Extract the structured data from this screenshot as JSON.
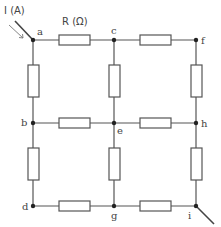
{
  "diagram": {
    "type": "resistor-grid-circuit",
    "current_label": "I (A)",
    "resistance_label": "R (Ω)",
    "input_node": "a",
    "output_node": "i",
    "nodes": [
      {
        "id": "a",
        "label": "a",
        "x": 33,
        "y": 40
      },
      {
        "id": "c",
        "label": "c",
        "x": 114,
        "y": 40
      },
      {
        "id": "f",
        "label": "f",
        "x": 196,
        "y": 40
      },
      {
        "id": "b",
        "label": "b",
        "x": 33,
        "y": 123
      },
      {
        "id": "e",
        "label": "e",
        "x": 114,
        "y": 123
      },
      {
        "id": "h",
        "label": "h",
        "x": 196,
        "y": 123
      },
      {
        "id": "d",
        "label": "d",
        "x": 33,
        "y": 206
      },
      {
        "id": "g",
        "label": "g",
        "x": 114,
        "y": 206
      },
      {
        "id": "i",
        "label": "i",
        "x": 196,
        "y": 206
      }
    ],
    "resistors": [
      {
        "from": "a",
        "to": "c"
      },
      {
        "from": "c",
        "to": "f"
      },
      {
        "from": "b",
        "to": "e"
      },
      {
        "from": "e",
        "to": "h"
      },
      {
        "from": "d",
        "to": "g"
      },
      {
        "from": "g",
        "to": "i"
      },
      {
        "from": "a",
        "to": "b"
      },
      {
        "from": "b",
        "to": "d"
      },
      {
        "from": "c",
        "to": "e"
      },
      {
        "from": "e",
        "to": "g"
      },
      {
        "from": "f",
        "to": "h"
      },
      {
        "from": "h",
        "to": "i"
      }
    ],
    "colors": {
      "wire": "#555555",
      "node": "#222222",
      "text": "#444444",
      "background": "#ffffff"
    }
  }
}
